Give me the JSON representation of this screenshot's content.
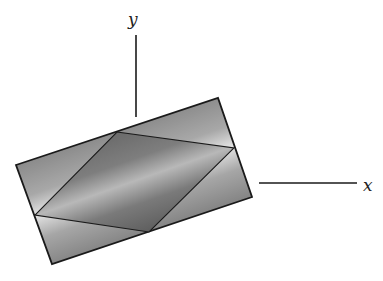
{
  "figure": {
    "axes": {
      "x_label": "x",
      "y_label": "y"
    },
    "rectangle": {
      "points": "16,165 218,98 252,197 52,264",
      "stroke": "#1a1a1a"
    },
    "parallelogram": {
      "points": "117,132 234,148 149,232 35,215",
      "stroke": "#1a1a1a"
    },
    "colors": {
      "rect_edge": "#8a8a8a",
      "rect_mid": "#e6e6e6",
      "para_edge": "#5a5a5a",
      "para_mid": "#b4b4b4",
      "axis": "#1a1a1a"
    }
  }
}
